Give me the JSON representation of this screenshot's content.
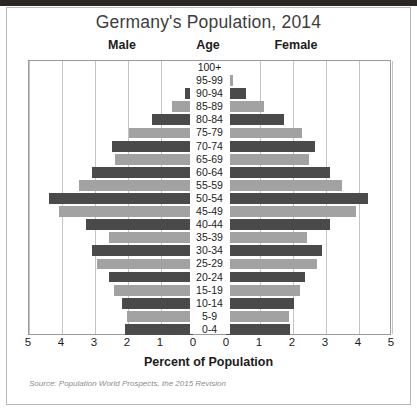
{
  "title": "Germany's Population, 2014",
  "headers": {
    "male": "Male",
    "age": "Age",
    "female": "Female"
  },
  "axis": {
    "xlabel": "Percent of Population",
    "ticks": [
      "5",
      "4",
      "3",
      "2",
      "1",
      "0",
      "0",
      "1",
      "2",
      "3",
      "4",
      "5"
    ]
  },
  "source": "Source: Population World Prospects, the 2015 Revision",
  "colors": {
    "bar_dark": "#4a4a4a",
    "bar_light": "#a2a2a2",
    "gridline": "#c4c4c4",
    "plot_border": "#9a9a9a",
    "title_text": "#3d3d3d",
    "body_text": "#1c1c1c",
    "source_text": "#8d8d8d",
    "page_border": "#b9b9b9",
    "scan_band": "#2a2724"
  },
  "chart_data": {
    "type": "bar",
    "subtype": "population-pyramid",
    "title": "Germany's Population, 2014",
    "xlabel": "Percent of Population",
    "ylabel": "Age",
    "xlim": [
      0,
      5
    ],
    "grid": true,
    "legend": "none",
    "categories": [
      "100+",
      "95-99",
      "90-94",
      "85-89",
      "80-84",
      "75-79",
      "70-74",
      "65-69",
      "60-64",
      "55-59",
      "50-54",
      "45-49",
      "40-44",
      "35-39",
      "30-34",
      "25-29",
      "20-24",
      "15-19",
      "10-14",
      "5-9",
      "0-4"
    ],
    "series": [
      {
        "name": "Male",
        "side": "left",
        "values": [
          0.02,
          0.08,
          0.25,
          0.65,
          1.25,
          1.95,
          2.45,
          2.35,
          3.05,
          3.45,
          4.35,
          4.05,
          3.25,
          2.55,
          3.05,
          2.9,
          2.55,
          2.4,
          2.15,
          2.0,
          2.05
        ]
      },
      {
        "name": "Female",
        "side": "right",
        "values": [
          0.05,
          0.22,
          0.6,
          1.15,
          1.75,
          2.3,
          2.7,
          2.5,
          3.15,
          3.5,
          4.3,
          3.95,
          3.15,
          2.45,
          2.9,
          2.75,
          2.4,
          2.25,
          2.05,
          1.9,
          1.95
        ]
      }
    ],
    "bar_shading": [
      "dark",
      "light",
      "dark",
      "light",
      "dark",
      "light",
      "dark",
      "light",
      "dark",
      "light",
      "dark",
      "light",
      "dark",
      "light",
      "dark",
      "light",
      "dark",
      "light",
      "dark",
      "light",
      "dark"
    ]
  }
}
